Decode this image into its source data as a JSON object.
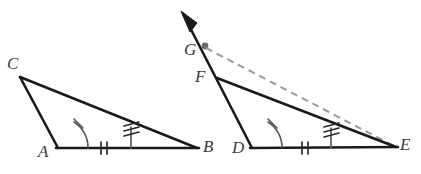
{
  "figure": {
    "background_color": "#ffffff",
    "stroke_color": "#1a1a1a",
    "mark_color": "#2b2b2b",
    "arc_color": "#55555a",
    "dashed_color": "#9a9aa0",
    "label_color": "#3a3a3f",
    "width": 421,
    "height": 174
  },
  "labels": {
    "C": "C",
    "A": "A",
    "B": "B",
    "G": "G",
    "F": "F",
    "D": "D",
    "E": "E"
  },
  "label_positions": {
    "C": {
      "x": 7,
      "y": 55
    },
    "A": {
      "x": 38,
      "y": 143
    },
    "B": {
      "x": 203,
      "y": 138
    },
    "G": {
      "x": 184,
      "y": 41
    },
    "F": {
      "x": 195,
      "y": 68
    },
    "D": {
      "x": 232,
      "y": 139
    },
    "E": {
      "x": 400,
      "y": 136
    }
  },
  "geometry": {
    "triangle_left": {
      "name": "triangle-ABC",
      "vertices": {
        "C": {
          "x": 20,
          "y": 77
        },
        "A": {
          "x": 58,
          "y": 148
        },
        "B": {
          "x": 197,
          "y": 148
        }
      },
      "cevian": {
        "x": 131,
        "y_base": 148,
        "y_top": 127,
        "ticks": 3
      },
      "base_ticks": {
        "x": 104,
        "y": 148,
        "ticks": 2
      },
      "angle_arc": {
        "vertex": "A",
        "radius": 30,
        "ticks": 1
      }
    },
    "triangle_right": {
      "name": "triangle-DEF",
      "vertices": {
        "F": {
          "x": 217,
          "y": 78
        },
        "D": {
          "x": 252,
          "y": 148
        },
        "E": {
          "x": 396,
          "y": 147
        }
      },
      "cevian": {
        "x": 331,
        "y_base": 148,
        "y_top": 128,
        "ticks": 3
      },
      "base_ticks": {
        "x": 305,
        "y": 148,
        "ticks": 2
      },
      "angle_arc": {
        "vertex": "D",
        "radius": 30,
        "ticks": 1
      }
    },
    "ray_through_G": {
      "name": "ray-GF-extended",
      "from": {
        "x": 181,
        "y": 11
      },
      "to": {
        "x": 252,
        "y": 148
      },
      "arrow_at": {
        "x": 181,
        "y": 11
      },
      "point_G": {
        "x": 205,
        "y": 46
      }
    },
    "dashed_line": {
      "name": "dashed-line-GE",
      "from": {
        "x": 206,
        "y": 48
      },
      "to": {
        "x": 396,
        "y": 147
      }
    }
  },
  "marks": {
    "single_tick_description": "one-slash",
    "double_tick_description": "two-slashes",
    "triple_tick_description": "three-slashes"
  }
}
